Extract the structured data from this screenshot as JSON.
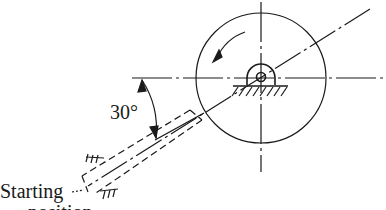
{
  "diagram": {
    "angle_label": "30°",
    "start_label": "Starting",
    "start_label_line2": "position",
    "rotation_direction": "counterclockwise",
    "elements": [
      "flywheel-circle",
      "pivot-bearing",
      "crank-link",
      "center-lines",
      "ground-hatching"
    ]
  }
}
